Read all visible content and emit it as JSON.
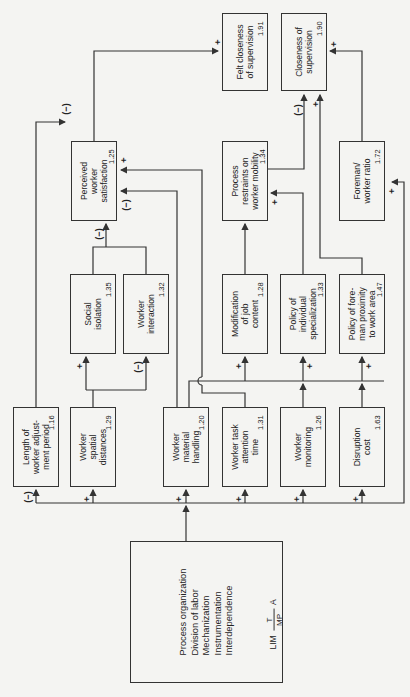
{
  "diagram": {
    "source": {
      "lines": [
        "Process organization",
        "Division of labor",
        "Mechanization",
        "Instrumentation",
        "Interdependence"
      ],
      "note": {
        "prefix": "LIM",
        "top": "T",
        "bottom": "MP",
        "suffix": "A"
      }
    },
    "boxes": {
      "length_adjustment": {
        "lines": [
          "Length of",
          "worker adjust-",
          "ment period"
        ],
        "value": "1.16"
      },
      "spatial_distances": {
        "lines": [
          "Worker",
          "spatial",
          "distances"
        ],
        "value": "1.29"
      },
      "material_handling": {
        "lines": [
          "Worker",
          "material",
          "handling"
        ],
        "value": "1.20"
      },
      "task_attention": {
        "lines": [
          "Worker task",
          "attention",
          "time"
        ],
        "value": "1.31"
      },
      "monitoring": {
        "lines": [
          "Worker",
          "monitoring"
        ],
        "value": "1.26"
      },
      "disruption_cost": {
        "lines": [
          "Disruption",
          "cost"
        ],
        "value": "1.63"
      },
      "social_isolation": {
        "lines": [
          "Social",
          "isolation"
        ],
        "value": "1.35"
      },
      "worker_interaction": {
        "lines": [
          "Worker",
          "interaction"
        ],
        "value": "1.32"
      },
      "job_content": {
        "lines": [
          "Modification",
          "of job",
          "content"
        ],
        "value": "1.28"
      },
      "specialization": {
        "lines": [
          "Policy of",
          "individual",
          "specialization"
        ],
        "value": "1.33"
      },
      "foreman_proximity": {
        "lines": [
          "Policy of fore-",
          "man proximity",
          "to work area"
        ],
        "value": "1.47"
      },
      "perceived_satisfaction": {
        "lines": [
          "Perceived",
          "worker",
          "satisfaction"
        ],
        "value": "1.25"
      },
      "process_restraints": {
        "lines": [
          "Process",
          "restraints on",
          "worker mobility"
        ],
        "value": "1.34"
      },
      "foreman_ratio": {
        "lines": [
          "Foreman/",
          "worker ratio"
        ],
        "value": "1.72"
      },
      "felt_closeness": {
        "lines": [
          "Felt closeness",
          "of supervision"
        ],
        "value": "1.91"
      },
      "closeness": {
        "lines": [
          "Closeness of",
          "supervision"
        ],
        "value": "1.90"
      }
    },
    "signs": {
      "plus": "+",
      "minus": "(−)"
    }
  }
}
